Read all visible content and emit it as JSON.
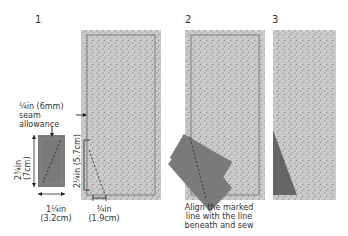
{
  "diagram": {
    "colors": {
      "strip_fill": "#c9c9c9",
      "strip_speckle": "#8f8f8f",
      "seam_line": "#6a6a6a",
      "piece_fill": "#7a7a7a",
      "piece_inner": "#888888",
      "dashed_line": "#2c2c2c",
      "dim_line": "#222222",
      "triangle_fill": "#666666"
    },
    "steps": [
      {
        "number": "1",
        "seam_allowance_label": [
          "¼in (6mm)",
          "seam",
          "allowance"
        ],
        "piece_height": [
          "2¾in",
          "(7cm)"
        ],
        "piece_width": [
          "1¼in",
          "(3.2cm)"
        ],
        "mark_height": "2¼in (5.7cm)",
        "mark_width": [
          "¾in",
          "(1.9cm)"
        ]
      },
      {
        "number": "2",
        "caption": [
          "Align the marked",
          "line with the line",
          "beneath and sew"
        ]
      },
      {
        "number": "3"
      }
    ]
  }
}
